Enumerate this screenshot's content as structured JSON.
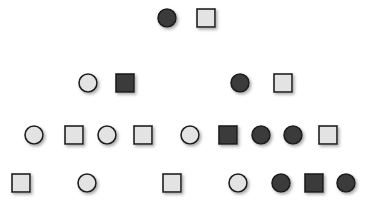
{
  "figure": {
    "type": "pedigree-chart",
    "width": 367,
    "height": 205,
    "background_color": "#ffffff",
    "generations": 4,
    "legend_implied": {
      "filled_shape": "affected individual",
      "unfilled_shape": "unaffected individual",
      "square": "male",
      "circle": "female"
    }
  },
  "style": {
    "affected_fill": "#3b3b3b",
    "unaffected_fill": "#e3e3e3",
    "stroke_color": "#1c1c1c",
    "stroke_width": 1.6,
    "line_color": "#262626",
    "line_width": 1.4,
    "shadow_color": "#b5b5b5",
    "symbol_size": 18,
    "circle_radius": 9
  },
  "chart_data": {
    "type": "diagram",
    "title": "",
    "individuals": [
      {
        "id": "I-1",
        "generation": 1,
        "sex": "female",
        "shape": "circle",
        "affected": true,
        "x": 167,
        "y": 18
      },
      {
        "id": "I-2",
        "generation": 1,
        "sex": "male",
        "shape": "square",
        "affected": false,
        "x": 206,
        "y": 18
      },
      {
        "id": "II-1",
        "generation": 2,
        "sex": "female",
        "shape": "circle",
        "affected": false,
        "x": 88,
        "y": 83
      },
      {
        "id": "II-2",
        "generation": 2,
        "sex": "male",
        "shape": "square",
        "affected": true,
        "x": 125,
        "y": 83
      },
      {
        "id": "II-3",
        "generation": 2,
        "sex": "female",
        "shape": "circle",
        "affected": true,
        "x": 240,
        "y": 83
      },
      {
        "id": "II-4",
        "generation": 2,
        "sex": "male",
        "shape": "square",
        "affected": false,
        "x": 283,
        "y": 83
      },
      {
        "id": "III-1",
        "generation": 3,
        "sex": "female",
        "shape": "circle",
        "affected": false,
        "x": 34,
        "y": 135
      },
      {
        "id": "III-2",
        "generation": 3,
        "sex": "male",
        "shape": "square",
        "affected": false,
        "x": 74,
        "y": 135
      },
      {
        "id": "III-3",
        "generation": 3,
        "sex": "female",
        "shape": "circle",
        "affected": false,
        "x": 107,
        "y": 135
      },
      {
        "id": "III-4",
        "generation": 3,
        "sex": "male",
        "shape": "square",
        "affected": false,
        "x": 143,
        "y": 135
      },
      {
        "id": "III-5",
        "generation": 3,
        "sex": "female",
        "shape": "circle",
        "affected": false,
        "x": 190,
        "y": 135
      },
      {
        "id": "III-6",
        "generation": 3,
        "sex": "male",
        "shape": "square",
        "affected": true,
        "x": 228,
        "y": 135
      },
      {
        "id": "III-7",
        "generation": 3,
        "sex": "female",
        "shape": "circle",
        "affected": true,
        "x": 261,
        "y": 135
      },
      {
        "id": "III-8",
        "generation": 3,
        "sex": "female",
        "shape": "circle",
        "affected": true,
        "x": 293,
        "y": 135
      },
      {
        "id": "III-9",
        "generation": 3,
        "sex": "male",
        "shape": "square",
        "affected": false,
        "x": 328,
        "y": 135
      },
      {
        "id": "IV-1",
        "generation": 4,
        "sex": "male",
        "shape": "square",
        "affected": false,
        "x": 21,
        "y": 183
      },
      {
        "id": "IV-2",
        "generation": 4,
        "sex": "female",
        "shape": "circle",
        "affected": false,
        "x": 87,
        "y": 183
      },
      {
        "id": "IV-3",
        "generation": 4,
        "sex": "male",
        "shape": "square",
        "affected": false,
        "x": 172,
        "y": 183
      },
      {
        "id": "IV-4",
        "generation": 4,
        "sex": "female",
        "shape": "circle",
        "affected": false,
        "x": 238,
        "y": 183
      },
      {
        "id": "IV-5",
        "generation": 4,
        "sex": "female",
        "shape": "circle",
        "affected": true,
        "x": 281,
        "y": 183
      },
      {
        "id": "IV-6",
        "generation": 4,
        "sex": "male",
        "shape": "square",
        "affected": true,
        "x": 314,
        "y": 183
      },
      {
        "id": "IV-7",
        "generation": 4,
        "sex": "female",
        "shape": "circle",
        "affected": true,
        "x": 346,
        "y": 183
      }
    ],
    "matings": [
      {
        "id": "M1",
        "partners": [
          "I-1",
          "I-2"
        ],
        "mating_line": {
          "x1": 176,
          "x2": 197,
          "y": 18
        },
        "descent_x": 186,
        "sibship_y": 50,
        "sibship_line": {
          "x1": 125,
          "x2": 240
        },
        "children": [
          "II-2",
          "II-3"
        ]
      },
      {
        "id": "M2",
        "partners": [
          "II-1",
          "II-2"
        ],
        "mating_line": {
          "x1": 97,
          "x2": 116,
          "y": 83
        },
        "descent_x": 107,
        "sibship_y": 112,
        "sibship_line": {
          "x1": 74,
          "x2": 143
        },
        "children": [
          "III-2",
          "III-3",
          "III-4"
        ]
      },
      {
        "id": "M3",
        "partners": [
          "II-3",
          "II-4"
        ],
        "mating_line": {
          "x1": 249,
          "x2": 274,
          "y": 83
        },
        "descent_x": 261,
        "sibship_y": 112,
        "sibship_line": {
          "x1": 228,
          "x2": 293
        },
        "children": [
          "III-6",
          "III-7",
          "III-8"
        ]
      },
      {
        "id": "M4",
        "partners": [
          "III-1",
          "III-2"
        ],
        "mating_line": {
          "x1": 43,
          "x2": 65,
          "y": 135
        },
        "descent_x": 54,
        "sibship_y": 163,
        "sibship_line": {
          "x1": 21,
          "x2": 87
        },
        "children": [
          "IV-1",
          "IV-2"
        ]
      },
      {
        "id": "M5",
        "partners": [
          "III-5",
          "III-6"
        ],
        "mating_line": {
          "x1": 199,
          "x2": 219,
          "y": 135
        },
        "descent_x": 206,
        "sibship_y": 163,
        "sibship_line": {
          "x1": 172,
          "x2": 238
        },
        "children": [
          "IV-3",
          "IV-4"
        ]
      },
      {
        "id": "M6",
        "partners": [
          "III-8",
          "III-9"
        ],
        "mating_line": {
          "x1": 302,
          "x2": 319,
          "y": 135
        },
        "descent_x": 313,
        "sibship_y": 163,
        "sibship_line": {
          "x1": 281,
          "x2": 346
        },
        "children": [
          "IV-5",
          "IV-6",
          "IV-7"
        ]
      }
    ],
    "counts": {
      "total_individuals": 22,
      "affected_individuals": 9,
      "unaffected_individuals": 13,
      "males": 10,
      "females": 12
    }
  }
}
